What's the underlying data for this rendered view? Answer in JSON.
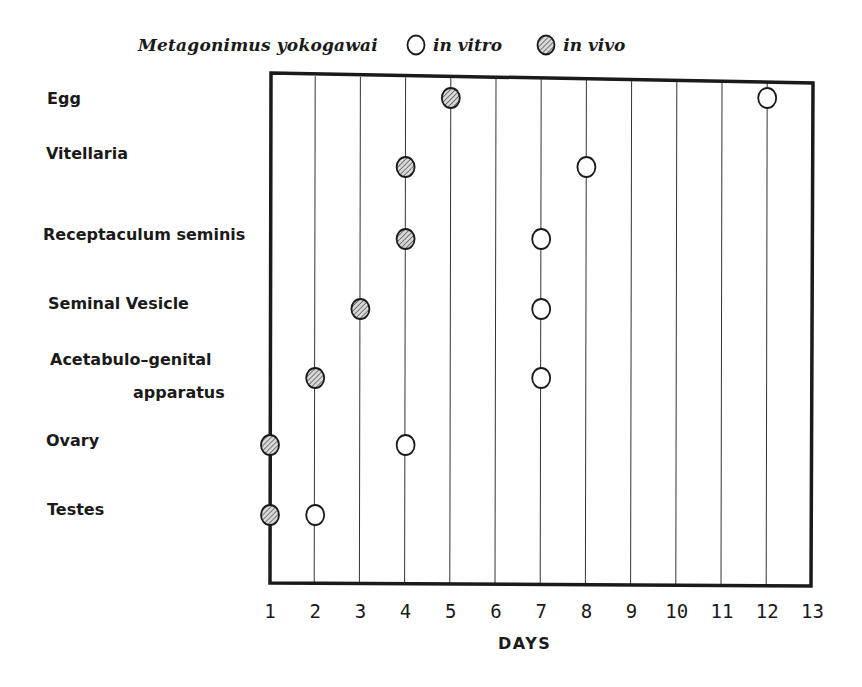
{
  "chart_data": {
    "type": "scatter",
    "title": "Metagonimus yokogawai",
    "xlabel": "DAYS",
    "ylabel": "",
    "x_ticks": [
      "1",
      "2",
      "3",
      "4",
      "5",
      "6",
      "7",
      "8",
      "9",
      "10",
      "11",
      "12",
      "13"
    ],
    "xlim": [
      1,
      13
    ],
    "grid": "vertical lines at each day",
    "legend_position": "top",
    "categories": [
      "Egg",
      "Vitellaria",
      "Receptaculum seminis",
      "Seminal Vesicle",
      "Acetabulo-genital apparatus",
      "Ovary",
      "Testes"
    ],
    "series": [
      {
        "name": "in vitro",
        "marker": "open circle",
        "values": [
          12,
          8,
          7,
          7,
          7,
          4,
          2
        ]
      },
      {
        "name": "in vivo",
        "marker": "hatched circle",
        "values": [
          5,
          4,
          4,
          3,
          2,
          1,
          1
        ]
      }
    ]
  },
  "legend": {
    "title": "Metagonimus yokogawai",
    "items": [
      {
        "label": "in vitro",
        "icon": "open-circle-icon"
      },
      {
        "label": "in vivo",
        "icon": "hatched-circle-icon"
      }
    ]
  },
  "rows": [
    {
      "label": "Egg"
    },
    {
      "label": "Vitellaria"
    },
    {
      "label": "Receptaculum seminis"
    },
    {
      "label": "Seminal Vesicle"
    },
    {
      "label": "Acetabulo–genital",
      "label2": "apparatus"
    },
    {
      "label": "Ovary"
    },
    {
      "label": "Testes"
    }
  ],
  "axis": {
    "xlabel": "DAYS",
    "ticks": [
      "1",
      "2",
      "3",
      "4",
      "5",
      "6",
      "7",
      "8",
      "9",
      "10",
      "11",
      "12",
      "13"
    ]
  }
}
